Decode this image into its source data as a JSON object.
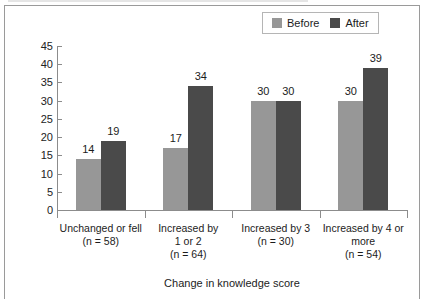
{
  "chart_data": {
    "type": "bar",
    "title": "",
    "subtitle": "",
    "xlabel": "Change in knowledge score",
    "ylabel": "",
    "ylim": [
      0,
      45
    ],
    "yticks": [
      0,
      5,
      10,
      15,
      20,
      25,
      30,
      35,
      40,
      45
    ],
    "grid": false,
    "legend_position": "top-right",
    "categories": [
      "Unchanged or fell\n(n = 58)",
      "Increased by\n1 or 2\n(n = 64)",
      "Increased by 3\n(n = 30)",
      "Increased by 4 or\nmore\n(n = 54)"
    ],
    "category_lines": [
      [
        "Unchanged or fell",
        "(n = 58)"
      ],
      [
        "Increased by",
        "1 or 2",
        "(n = 64)"
      ],
      [
        "Increased by 3",
        "(n = 30)"
      ],
      [
        "Increased by 4 or",
        "more",
        "(n = 54)"
      ]
    ],
    "series": [
      {
        "name": "Before",
        "color": "#979797",
        "values": [
          14,
          17,
          30,
          30
        ]
      },
      {
        "name": "After",
        "color": "#4a4a4a",
        "values": [
          19,
          34,
          30,
          39
        ]
      }
    ],
    "data_labels": [
      [
        "14",
        "19"
      ],
      [
        "17",
        "34"
      ],
      [
        "30",
        "30"
      ],
      [
        "30",
        "39"
      ]
    ]
  },
  "legend": {
    "items": [
      {
        "label": "Before",
        "color": "#979797"
      },
      {
        "label": "After",
        "color": "#4a4a4a"
      }
    ]
  },
  "axis": {
    "y_tick_labels": [
      "45",
      "40",
      "35",
      "30",
      "25",
      "20",
      "15",
      "10",
      "5",
      "0"
    ],
    "x_title": "Change in knowledge score"
  }
}
